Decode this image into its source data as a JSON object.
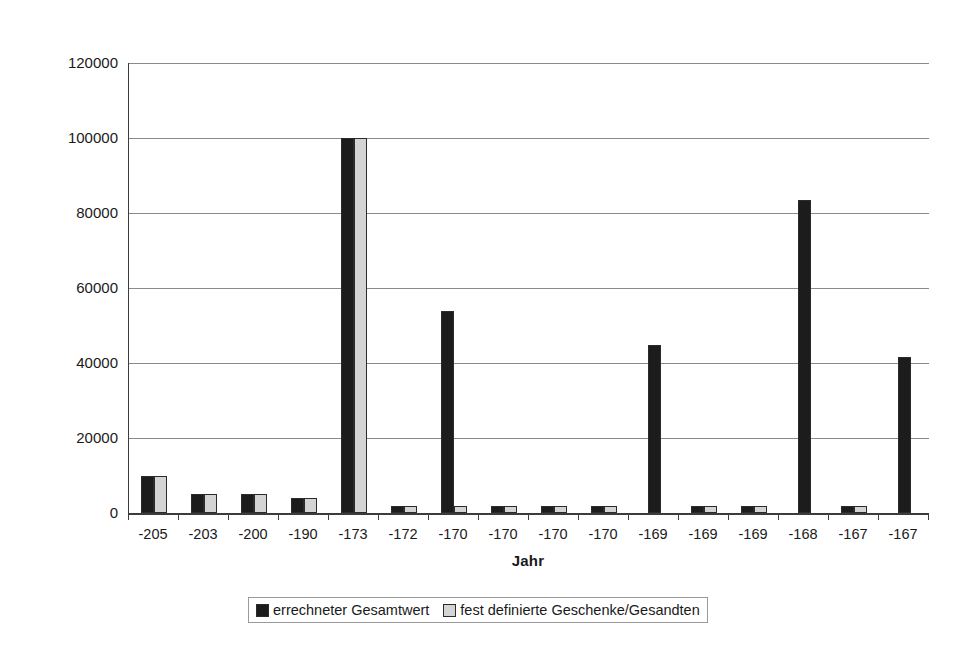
{
  "chart_data": {
    "type": "bar",
    "title": "",
    "xlabel": "Jahr",
    "ylabel": "Gesamtwert in As",
    "ylim": [
      0,
      120000
    ],
    "yticks": [
      0,
      20000,
      40000,
      60000,
      80000,
      100000,
      120000
    ],
    "ytick_labels": [
      "0",
      "20000",
      "40000",
      "60000",
      "80000",
      "100000",
      "120000"
    ],
    "grid": true,
    "legend_position": "bottom",
    "categories": [
      "-205",
      "-203",
      "-200",
      "-190",
      "-173",
      "-172",
      "-170",
      "-170",
      "-170",
      "-170",
      "-169",
      "-169",
      "-169",
      "-168",
      "-167",
      "-167"
    ],
    "series": [
      {
        "name": "errechneter Gesamtwert",
        "color": "#1c1c1c",
        "values": [
          10000,
          5000,
          5000,
          4000,
          100000,
          2000,
          54000,
          2000,
          2000,
          2000,
          44800,
          2000,
          2000,
          83500,
          1800,
          41600
        ]
      },
      {
        "name": "fest definierte Geschenke/Gesandten",
        "color": "#d4d4d4",
        "values": [
          10000,
          5000,
          5000,
          4000,
          100000,
          2000,
          2000,
          2000,
          2000,
          2000,
          0,
          2000,
          2000,
          0,
          1800,
          0
        ]
      }
    ]
  },
  "legend": {
    "entries": [
      {
        "label": "errechneter Gesamtwert"
      },
      {
        "label": "fest definierte Geschenke/Gesandten"
      }
    ]
  }
}
